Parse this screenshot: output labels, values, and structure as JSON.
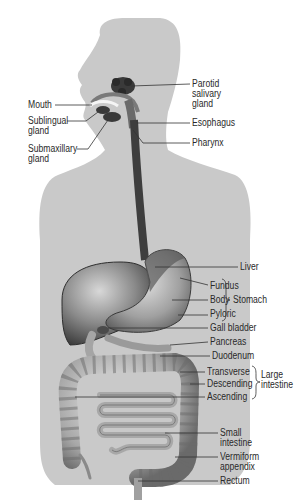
{
  "diagram": {
    "colors": {
      "background": "#ffffff",
      "silhouette": "#c9c9c9",
      "organ_dark": "#4a4a4a",
      "organ_mid": "#8a8a8a",
      "organ_light": "#bdbdbd",
      "label_text": "#2a2a2a",
      "leader_line": "#333333"
    },
    "labels": {
      "mouth": "Mouth",
      "sublingual_gland": "Sublingual\ngland",
      "submaxillary_gland": "Submaxillary\ngland",
      "parotid_salivary_gland": "Parotid\nsalivary\ngland",
      "esophagus": "Esophagus",
      "pharynx": "Pharynx",
      "liver": "Liver",
      "fundus": "Fundus",
      "body": "Body",
      "pyloric": "Pyloric",
      "stomach": "Stomach",
      "gall_bladder": "Gall bladder",
      "pancreas": "Pancreas",
      "duodenum": "Duodenum",
      "transverse": "Transverse",
      "descending": "Descending",
      "ascending": "Ascending",
      "large_intestine": "Large\nintestine",
      "small_intestine": "Small\nintestine",
      "vermiform_appendix": "Vermiform\nappendix",
      "rectum": "Rectum"
    },
    "groups": [
      {
        "name": "Stomach",
        "members": [
          "Fundus",
          "Body",
          "Pyloric"
        ]
      },
      {
        "name": "Large intestine",
        "members": [
          "Transverse",
          "Descending",
          "Ascending"
        ]
      }
    ]
  }
}
